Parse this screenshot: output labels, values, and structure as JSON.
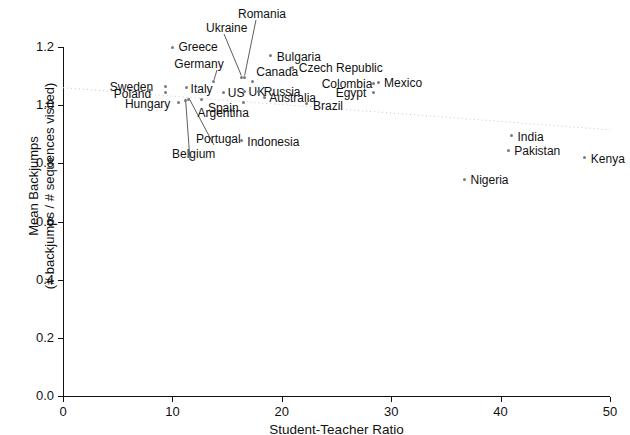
{
  "chart_data": {
    "type": "scatter",
    "title": "",
    "xlabel": "Student-Teacher Ratio",
    "ylabel_line1": "Mean Backjumps",
    "ylabel_line2": "(# backjumps / # sequences visited)",
    "xlim": [
      0,
      50
    ],
    "ylim": [
      0.0,
      1.25
    ],
    "xticks": [
      "0",
      "10",
      "20",
      "30",
      "40",
      "50"
    ],
    "xtick_values": [
      0,
      10,
      20,
      30,
      40,
      50
    ],
    "yticks": [
      "0.0",
      "0.2",
      "0.4",
      "0.6",
      "0.8",
      "1.0",
      "1.2"
    ],
    "ytick_values": [
      0.0,
      0.2,
      0.4,
      0.6,
      0.8,
      1.0,
      1.2
    ],
    "grid": false,
    "legend": "none",
    "points": [
      {
        "name": "Greece",
        "x": 10.0,
        "y": 1.2,
        "lx": 6,
        "ly": -6,
        "anchor": "start",
        "leader": false
      },
      {
        "name": "Ukraine",
        "x": 16.3,
        "y": 1.095,
        "lx": -52,
        "ly": -68,
        "anchor": "start",
        "leader": true,
        "tx": 206,
        "ty": 22
      },
      {
        "name": "Romania",
        "x": 16.6,
        "y": 1.095,
        "lx": 0,
        "ly": -80,
        "anchor": "start",
        "leader": true,
        "tx": 238,
        "ty": 8
      },
      {
        "name": "Bulgaria",
        "x": 19.0,
        "y": 1.17,
        "lx": 6,
        "ly": -5,
        "anchor": "start",
        "leader": false
      },
      {
        "name": "Czech Republic",
        "x": 21.0,
        "y": 1.13,
        "lx": 6,
        "ly": -5,
        "anchor": "start",
        "leader": false
      },
      {
        "name": "Germany",
        "x": 13.8,
        "y": 1.08,
        "lx": -3,
        "ly": -36,
        "anchor": "middle",
        "leader": true,
        "tx": 199,
        "ty": 58
      },
      {
        "name": "Canada",
        "x": 17.3,
        "y": 1.08,
        "lx": 4,
        "ly": -16,
        "anchor": "start",
        "leader": false
      },
      {
        "name": "Colombia",
        "x": 28.4,
        "y": 1.075,
        "lx": -52,
        "ly": -5,
        "anchor": "start",
        "leader": false
      },
      {
        "name": "Mexico",
        "x": 28.8,
        "y": 1.078,
        "lx": 6,
        "ly": -5,
        "anchor": "start",
        "leader": false
      },
      {
        "name": "Sweden",
        "x": 9.4,
        "y": 1.065,
        "lx": -56,
        "ly": -5,
        "anchor": "start",
        "leader": false
      },
      {
        "name": "Poland",
        "x": 9.4,
        "y": 1.043,
        "lx": -52,
        "ly": -5,
        "anchor": "start",
        "leader": false
      },
      {
        "name": "Italy",
        "x": 11.3,
        "y": 1.06,
        "lx": 4,
        "ly": -5,
        "anchor": "start",
        "leader": false
      },
      {
        "name": "US",
        "x": 14.7,
        "y": 1.045,
        "lx": 4,
        "ly": -5,
        "anchor": "start",
        "leader": false
      },
      {
        "name": "UK",
        "x": 16.6,
        "y": 1.048,
        "lx": 4,
        "ly": -5,
        "anchor": "start",
        "leader": false
      },
      {
        "name": "Russia",
        "x": 17.9,
        "y": 1.048,
        "lx": 5,
        "ly": -5,
        "anchor": "start",
        "leader": false
      },
      {
        "name": "Egypt",
        "x": 28.4,
        "y": 1.045,
        "lx": -38,
        "ly": -5,
        "anchor": "start",
        "leader": false
      },
      {
        "name": "Australia",
        "x": 18.4,
        "y": 1.028,
        "lx": 5,
        "ly": -5,
        "anchor": "start",
        "leader": false
      },
      {
        "name": "Spain",
        "x": 12.7,
        "y": 1.02,
        "lx": 6,
        "ly": 3,
        "anchor": "start",
        "leader": false
      },
      {
        "name": "Hungary",
        "x": 10.6,
        "y": 1.01,
        "lx": -54,
        "ly": -4,
        "anchor": "start",
        "leader": false
      },
      {
        "name": "Argentina",
        "x": 16.5,
        "y": 1.008,
        "lx": -46,
        "ly": 4,
        "anchor": "start",
        "leader": false
      },
      {
        "name": "Brazil",
        "x": 22.3,
        "y": 1.005,
        "lx": 6,
        "ly": -4,
        "anchor": "start",
        "leader": false
      },
      {
        "name": "Portugal",
        "x": 11.5,
        "y": 1.018,
        "lx": 14,
        "ly": 26,
        "anchor": "start",
        "leader": true,
        "tx": 196,
        "ty": 133
      },
      {
        "name": "Belgium",
        "x": 11.2,
        "y": 1.015,
        "lx": -22,
        "ly": 40,
        "anchor": "start",
        "leader": true,
        "tx": 172,
        "ty": 148
      },
      {
        "name": "Indonesia",
        "x": 16.3,
        "y": 0.88,
        "lx": 6,
        "ly": -4,
        "anchor": "start",
        "leader": false
      },
      {
        "name": "India",
        "x": 41.0,
        "y": 0.895,
        "lx": 6,
        "ly": -5,
        "anchor": "start",
        "leader": false
      },
      {
        "name": "Pakistan",
        "x": 40.7,
        "y": 0.845,
        "lx": 6,
        "ly": -5,
        "anchor": "start",
        "leader": false
      },
      {
        "name": "Kenya",
        "x": 47.7,
        "y": 0.82,
        "lx": 6,
        "ly": -5,
        "anchor": "start",
        "leader": false
      },
      {
        "name": "Nigeria",
        "x": 36.7,
        "y": 0.745,
        "lx": 6,
        "ly": -5,
        "anchor": "start",
        "leader": false
      }
    ],
    "trend_line": {
      "x1": 0,
      "y1": 1.06,
      "x2": 50,
      "y2": 0.915,
      "style": "dotted"
    }
  }
}
